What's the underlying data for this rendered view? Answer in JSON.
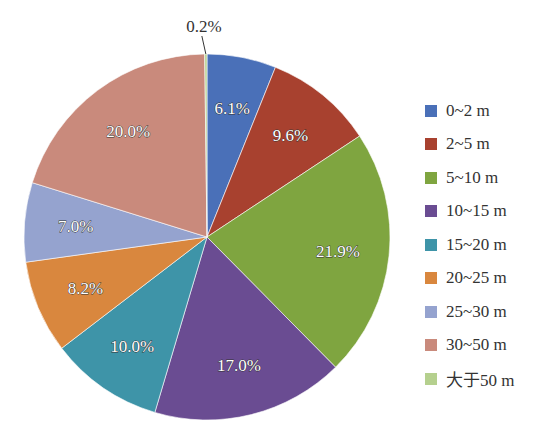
{
  "chart_data": {
    "type": "pie",
    "title": "",
    "categories": [
      "0~2 m",
      "2~5 m",
      "5~10 m",
      "10~15 m",
      "15~20 m",
      "20~25 m",
      "25~30 m",
      "30~50 m",
      "大于50 m"
    ],
    "values": [
      6.1,
      9.6,
      21.9,
      17.0,
      10.0,
      8.2,
      7.0,
      20.0,
      0.2
    ],
    "labels": [
      "6.1%",
      "9.6%",
      "21.9%",
      "17.0%",
      "10.0%",
      "8.2%",
      "7.0%",
      "20.0%",
      "0.2%"
    ],
    "colors": [
      "#4a70b8",
      "#a8412f",
      "#7fa540",
      "#6a4c92",
      "#3e94a8",
      "#d9873e",
      "#95a3cf",
      "#c98a7c",
      "#b5d08e"
    ],
    "unit": "%",
    "legend_position": "right",
    "start_angle_deg": 0,
    "direction": "clockwise"
  },
  "legend": {
    "items": [
      {
        "label": "0~2 m",
        "color": "#4a70b8"
      },
      {
        "label": "2~5 m",
        "color": "#a8412f"
      },
      {
        "label": "5~10 m",
        "color": "#7fa540"
      },
      {
        "label": "10~15 m",
        "color": "#6a4c92"
      },
      {
        "label": "15~20 m",
        "color": "#3e94a8"
      },
      {
        "label": "20~25 m",
        "color": "#d9873e"
      },
      {
        "label": "25~30 m",
        "color": "#95a3cf"
      },
      {
        "label": "30~50 m",
        "color": "#c98a7c"
      },
      {
        "label": "大于50 m",
        "color": "#b5d08e"
      }
    ]
  }
}
